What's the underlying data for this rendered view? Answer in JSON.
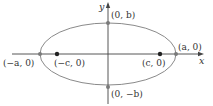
{
  "diagram": {
    "type": "ellipse-with-foci",
    "colors": {
      "ellipse": "#8a8a8a",
      "axes": "#444444",
      "focus_point": "#222222",
      "vertex_point": "#7a7a7a",
      "text": "#333333"
    },
    "axes": {
      "x_label": "x",
      "y_label": "y"
    },
    "points": {
      "left_vertex": "(−a, 0)",
      "right_vertex": "(a, 0)",
      "left_focus": "(−c, 0)",
      "right_focus": "(c, 0)",
      "top_covertex": "(0, b)",
      "bottom_covertex": "(0, −b)"
    }
  }
}
